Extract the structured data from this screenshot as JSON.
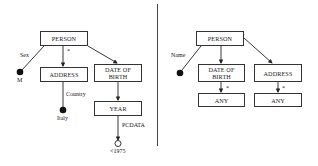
{
  "left_diagram": {
    "nodes": {
      "person": "PERSON",
      "address": "ADDRESS",
      "date_of_birth": "DATE OF BIRTH",
      "year": "YEAR"
    },
    "edge_labels": {
      "sex": "Sex",
      "star": "*",
      "country": "Country",
      "pcdata": "PCDATA"
    },
    "leaf_values": {
      "m": "M",
      "italy": "Italy",
      "lt1975": "<1975"
    }
  },
  "right_diagram": {
    "nodes": {
      "person": "PERSON",
      "date_of_birth": "DATE OF BIRTH",
      "address": "ADDRESS",
      "any_1": "ANY",
      "any_2": "ANY"
    },
    "edge_labels": {
      "name": "Name",
      "star_1": "*",
      "star_2": "*"
    }
  }
}
